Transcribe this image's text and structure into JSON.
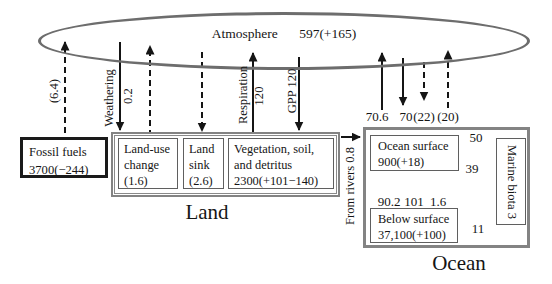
{
  "atmosphere": {
    "label": "Atmosphere",
    "stock": "597(+165)"
  },
  "fossil_fuels": {
    "name": "Fossil fuels",
    "stock": "3700(−244)"
  },
  "land": {
    "label": "Land",
    "land_use_change": {
      "line1": "Land-use",
      "line2": "change",
      "line3": "(1.6)"
    },
    "land_sink": {
      "line1": "Land",
      "line2": "sink",
      "line3": "(2.6)"
    },
    "vegetation": {
      "line1": "Vegetation, soil,",
      "line2": "and detritus",
      "line3": "2300(+101−140)"
    }
  },
  "ocean": {
    "label": "Ocean",
    "ocean_surface": {
      "line1": "Ocean surface",
      "line2": "900(+18)"
    },
    "below_surface": {
      "line1": "Below surface",
      "line2": "37,100(+100)"
    },
    "marine_biota": "Marine biota 3"
  },
  "fluxes": {
    "fossil_emissions": "(6.4)",
    "weathering_label": "Weathering",
    "weathering_value": "0.2",
    "respiration_label": "Respiration",
    "respiration_value": "120",
    "gpp": "GPP 120",
    "ocean_outgassing": "70.6",
    "ocean_uptake": "70",
    "ocean_uptake_anthropogenic": "(22)",
    "ocean_release_anthropogenic": "(20)",
    "from_rivers": "From rivers 0.8",
    "surface_to_biota": "50",
    "biota_to_surface": "39",
    "surface_to_deep": "90.2",
    "deep_to_surface": "101",
    "surface_to_deep_anthropogenic": "1.6",
    "biota_to_deep": "11"
  }
}
